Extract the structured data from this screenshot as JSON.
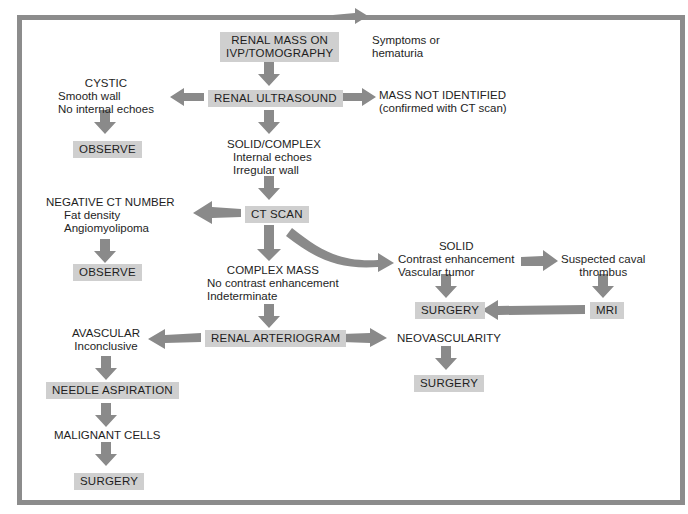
{
  "colors": {
    "frame": "#8c8c8c",
    "box_fill": "#cfcfcf",
    "arrow": "#8a8a8a",
    "text": "#1e1e1e",
    "background": "#ffffff"
  },
  "nodes": {
    "start": {
      "line1": "RENAL MASS ON",
      "line2": "IVP/TOMOGRAPHY"
    },
    "symptoms": {
      "line1": "Symptoms or",
      "line2": "hematuria"
    },
    "ultrasound": {
      "label": "RENAL ULTRASOUND"
    },
    "cystic": {
      "title": "CYSTIC",
      "line1": "Smooth wall",
      "line2": "No internal echoes"
    },
    "observe1": {
      "label": "OBSERVE"
    },
    "not_identified": {
      "line1": "MASS NOT IDENTIFIED",
      "line2": "(confirmed with CT scan)"
    },
    "solid_complex": {
      "title": "SOLID/COMPLEX",
      "line1": "Internal echoes",
      "line2": "Irregular wall"
    },
    "ct_scan": {
      "label": "CT SCAN"
    },
    "negative_ct": {
      "title": "NEGATIVE CT NUMBER",
      "line1": "Fat density",
      "line2": "Angiomyolipoma"
    },
    "observe2": {
      "label": "OBSERVE"
    },
    "complex_mass": {
      "title": "COMPLEX MASS",
      "line1": "No contrast enhancement",
      "line2": "Indeterminate"
    },
    "solid": {
      "title": "SOLID",
      "line1": "Contrast enhancement",
      "line2": "Vascular tumor"
    },
    "caval": {
      "line1": "Suspected caval",
      "line2": "thrombus"
    },
    "surgery_solid": {
      "label": "SURGERY"
    },
    "mri": {
      "label": "MRI"
    },
    "arteriogram": {
      "label": "RENAL ARTERIOGRAM"
    },
    "avascular": {
      "title": "AVASCULAR",
      "line1": "Inconclusive"
    },
    "neovascularity": {
      "label": "NEOVASCULARITY"
    },
    "surgery_neo": {
      "label": "SURGERY"
    },
    "needle": {
      "label": "NEEDLE ASPIRATION"
    },
    "malignant": {
      "label": "MALIGNANT CELLS"
    },
    "surgery_final": {
      "label": "SURGERY"
    }
  },
  "edges": [
    [
      "start",
      "symptoms"
    ],
    [
      "start",
      "ultrasound"
    ],
    [
      "ultrasound",
      "cystic"
    ],
    [
      "ultrasound",
      "not_identified"
    ],
    [
      "ultrasound",
      "solid_complex"
    ],
    [
      "cystic",
      "observe1"
    ],
    [
      "solid_complex",
      "ct_scan"
    ],
    [
      "ct_scan",
      "negative_ct"
    ],
    [
      "ct_scan",
      "complex_mass"
    ],
    [
      "ct_scan",
      "solid"
    ],
    [
      "negative_ct",
      "observe2"
    ],
    [
      "solid",
      "surgery_solid"
    ],
    [
      "solid",
      "caval"
    ],
    [
      "caval",
      "mri"
    ],
    [
      "mri",
      "surgery_solid"
    ],
    [
      "complex_mass",
      "arteriogram"
    ],
    [
      "arteriogram",
      "avascular"
    ],
    [
      "arteriogram",
      "neovascularity"
    ],
    [
      "neovascularity",
      "surgery_neo"
    ],
    [
      "avascular",
      "needle"
    ],
    [
      "needle",
      "malignant"
    ],
    [
      "malignant",
      "surgery_final"
    ]
  ]
}
